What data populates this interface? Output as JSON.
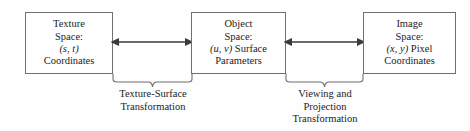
{
  "diagram": {
    "line_color": "#6f6f6f",
    "text_color": "#1c1c1c",
    "background": "#fefefe",
    "boxes": [
      {
        "id": "texture-space",
        "line1": "Texture",
        "line2": "Space:",
        "line3": "(s, t)",
        "line4": "Coordinates"
      },
      {
        "id": "object-space",
        "line1": "Object",
        "line2": "Space:",
        "line3": "(u, v)",
        "line3_suffix": " Surface",
        "line4": "Parameters"
      },
      {
        "id": "image-space",
        "line1": "Image",
        "line2": "Space:",
        "line3": "(x, y)",
        "line3_suffix": " Pixel",
        "line4": "Coordinates"
      }
    ],
    "connectors": [
      {
        "id": "texture-to-object",
        "type": "double-headed-arrow",
        "from": "texture-space",
        "to": "object-space"
      },
      {
        "id": "object-to-image",
        "type": "double-headed-arrow",
        "from": "object-space",
        "to": "image-space"
      }
    ],
    "captions": [
      {
        "id": "texture-surface-transformation",
        "line1": "Texture-Surface",
        "line2": "Transformation",
        "line3": ""
      },
      {
        "id": "viewing-projection-transformation",
        "line1": "Viewing and",
        "line2": "Projection",
        "line3": "Transformation"
      }
    ]
  }
}
